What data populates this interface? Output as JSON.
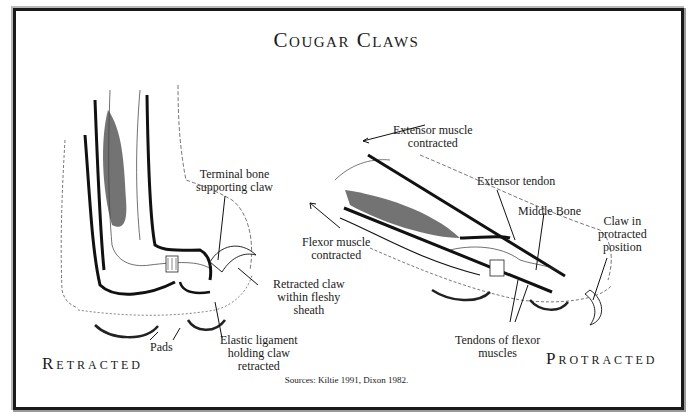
{
  "title": "Cougar Claws",
  "retracted": {
    "heading": "Retracted",
    "labels": {
      "terminal_bone": [
        "Terminal bone",
        "supporting claw"
      ],
      "retracted_claw": [
        "Retracted claw",
        "within fleshy",
        "sheath"
      ],
      "pads": "Pads",
      "elastic_ligament": [
        "Elastic ligament",
        "holding claw",
        "retracted"
      ]
    }
  },
  "protracted": {
    "heading": "Protracted",
    "labels": {
      "extensor_muscle": [
        "Extensor muscle",
        "contracted"
      ],
      "extensor_tendon": "Extensor tendon",
      "middle_bone": "Middle Bone",
      "claw_position": [
        "Claw in",
        "protracted",
        "position"
      ],
      "flexor_muscle": [
        "Flexor muscle",
        "contracted"
      ],
      "flexor_tendons": [
        "Tendons of flexor",
        "muscles"
      ]
    }
  },
  "sources": "Sources: Kiltie 1991, Dixon 1982."
}
